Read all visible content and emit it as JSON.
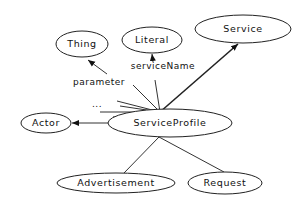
{
  "diagram": {
    "type": "ontology-graph",
    "nodes": {
      "thing": {
        "label": "Thing"
      },
      "literal": {
        "label": "Literal"
      },
      "service": {
        "label": "Service"
      },
      "actor": {
        "label": "Actor"
      },
      "service_profile": {
        "label": "ServiceProfile"
      },
      "advertisement": {
        "label": "Advertisement"
      },
      "request": {
        "label": "Request"
      }
    },
    "edges": {
      "parameter": {
        "label": "parameter",
        "from": "ServiceProfile",
        "to": "Thing",
        "arrow": true
      },
      "service_name": {
        "label": "serviceName",
        "from": "ServiceProfile",
        "to": "Literal",
        "arrow": true
      },
      "to_service": {
        "label": "",
        "from": "ServiceProfile",
        "to": "Service",
        "arrow": true
      },
      "to_actor": {
        "label": "",
        "from": "ServiceProfile",
        "to": "Actor",
        "arrow": true
      },
      "to_advertisement": {
        "label": "",
        "from": "ServiceProfile",
        "to": "Advertisement",
        "arrow": false
      },
      "to_request": {
        "label": "",
        "from": "ServiceProfile",
        "to": "Request",
        "arrow": false
      },
      "ellipsis": {
        "label": "..."
      }
    }
  }
}
